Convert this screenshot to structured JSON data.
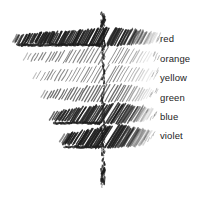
{
  "figure": {
    "background_color": "#ffffff",
    "ink_color": "#1d1d1d",
    "style": "pencil hatching sketch"
  },
  "axis": {
    "name": "vertical-dotted-axis",
    "orientation": "vertical",
    "x": 103,
    "y_top": 12,
    "y_bottom": 186,
    "style": "ragged hand-drawn broken line"
  },
  "chart_data": {
    "type": "bar",
    "title": "",
    "xlabel": "",
    "ylabel": "",
    "orientation": "horizontal",
    "grid": false,
    "legend_position": "right",
    "categories": [
      "red",
      "orange",
      "yellow",
      "green",
      "blue",
      "violet"
    ],
    "values": [
      90,
      78,
      70,
      62,
      52,
      40
    ],
    "shade": [
      0.92,
      0.38,
      0.34,
      0.55,
      0.86,
      0.95
    ],
    "bands": [
      {
        "label": "red",
        "label_x": 160,
        "label_y": 34,
        "y_top": 28,
        "y_bottom": 46,
        "left_x": 13,
        "right_x": 152,
        "width": 139,
        "density": 0.92,
        "hatch_angle": 62
      },
      {
        "label": "orange",
        "label_x": 160,
        "label_y": 54,
        "y_top": 47,
        "y_bottom": 64,
        "left_x": 24,
        "right_x": 150,
        "width": 126,
        "density": 0.38,
        "hatch_angle": 60
      },
      {
        "label": "yellow",
        "label_x": 160,
        "label_y": 73,
        "y_top": 65,
        "y_bottom": 83,
        "left_x": 33,
        "right_x": 150,
        "width": 117,
        "density": 0.34,
        "hatch_angle": 60
      },
      {
        "label": "green",
        "label_x": 160,
        "label_y": 93,
        "y_top": 84,
        "y_bottom": 102,
        "left_x": 41,
        "right_x": 148,
        "width": 107,
        "density": 0.55,
        "hatch_angle": 60
      },
      {
        "label": "blue",
        "label_x": 160,
        "label_y": 112,
        "y_top": 103,
        "y_bottom": 124,
        "left_x": 50,
        "right_x": 146,
        "width": 96,
        "density": 0.86,
        "hatch_angle": 58
      },
      {
        "label": "violet",
        "label_x": 160,
        "label_y": 131,
        "y_top": 125,
        "y_bottom": 148,
        "left_x": 60,
        "right_x": 144,
        "width": 84,
        "density": 0.95,
        "hatch_angle": 58
      }
    ]
  }
}
